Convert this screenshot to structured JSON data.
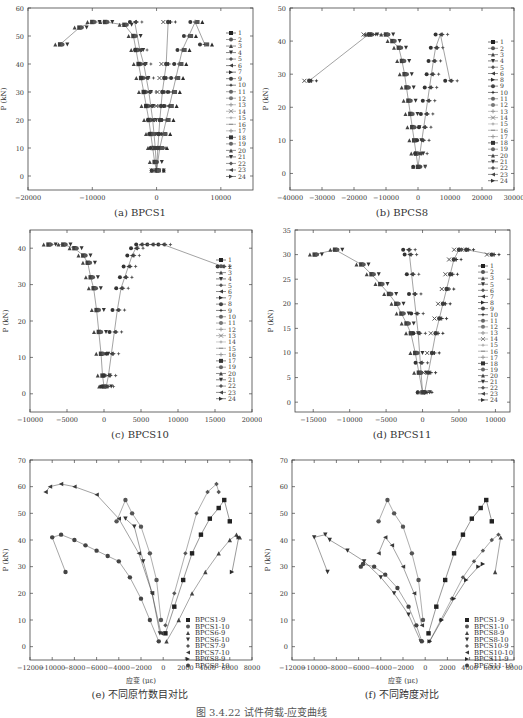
{
  "figure_caption": "图 3.4.22  试件荷载-应变曲线",
  "chart_data": [
    {
      "id": "a",
      "type": "scatter",
      "title": "(a) BPCS1",
      "xlabel": "应变 (με)",
      "ylabel": "P (kN)",
      "xlim": [
        -20000,
        15000
      ],
      "ylim": [
        -5,
        60
      ],
      "xticks": [
        -20000,
        -10000,
        0,
        10000
      ],
      "yticks": [
        0,
        10,
        20,
        30,
        40,
        50,
        60
      ],
      "legend": [
        "1",
        "2",
        "3",
        "4",
        "5",
        "6",
        "7",
        "9",
        "10",
        "11",
        "12",
        "13",
        "14",
        "15",
        "16",
        "17",
        "18",
        "19",
        "20",
        "21",
        "22",
        "23",
        "24"
      ],
      "legend_position": "right",
      "series": [
        {
          "name": "compression-outer",
          "x": [
            0,
            -300,
            -600,
            -900,
            -1200,
            -1600,
            -2000,
            -2400,
            -2800,
            -3200,
            -3600,
            -5000,
            -8000,
            -10000,
            -12000,
            -15000
          ],
          "y": [
            2,
            5,
            10,
            15,
            20,
            25,
            30,
            35,
            40,
            45,
            50,
            54,
            55,
            55,
            53,
            47
          ]
        },
        {
          "name": "compression-inner",
          "x": [
            0,
            -200,
            -400,
            -600,
            -900,
            -1200,
            -1600,
            -2000,
            -2600,
            -3400
          ],
          "y": [
            2,
            10,
            15,
            20,
            25,
            30,
            35,
            40,
            45,
            55
          ]
        },
        {
          "name": "tension-near",
          "x": [
            0,
            200,
            350,
            500,
            700,
            900,
            1200,
            1500,
            1800
          ],
          "y": [
            2,
            10,
            15,
            20,
            25,
            30,
            35,
            40,
            55
          ]
        },
        {
          "name": "tension-outer",
          "x": [
            0,
            500,
            1000,
            1500,
            2000,
            2500,
            3000,
            3500,
            4000,
            5000,
            6000,
            7500
          ],
          "y": [
            2,
            10,
            15,
            20,
            25,
            30,
            35,
            40,
            45,
            50,
            55,
            47
          ]
        }
      ]
    },
    {
      "id": "b",
      "type": "scatter",
      "title": "(b) BPCS8",
      "xlabel": "应变 (με)",
      "ylabel": "P (kN)",
      "xlim": [
        -40000,
        30000
      ],
      "ylim": [
        -5,
        50
      ],
      "xticks": [
        -40000,
        -30000,
        -20000,
        -10000,
        0,
        10000,
        20000,
        30000
      ],
      "yticks": [
        0,
        10,
        20,
        30,
        40,
        50
      ],
      "legend": [
        "1",
        "2",
        "3",
        "4",
        "5",
        "6",
        "8",
        "9",
        "10",
        "11",
        "12",
        "13",
        "14",
        "15",
        "16",
        "17",
        "18",
        "19",
        "20",
        "21",
        "22",
        "23",
        "24"
      ],
      "legend_position": "right",
      "series": [
        {
          "name": "compression",
          "x": [
            0,
            -600,
            -1200,
            -1800,
            -2400,
            -3000,
            -3600,
            -4200,
            -5000,
            -6000,
            -8000,
            -10000,
            -15000
          ],
          "y": [
            2,
            6,
            10,
            14,
            18,
            22,
            26,
            30,
            34,
            38,
            40,
            42,
            42
          ]
        },
        {
          "name": "tension",
          "x": [
            0,
            600,
            1200,
            1800,
            2400,
            3000,
            3600,
            4200,
            4800,
            5500,
            7000,
            10000
          ],
          "y": [
            2,
            6,
            10,
            14,
            18,
            22,
            26,
            30,
            34,
            38,
            42,
            28
          ]
        },
        {
          "name": "outlier",
          "x": [
            -15500,
            -34000
          ],
          "y": [
            42,
            28
          ]
        }
      ]
    },
    {
      "id": "c",
      "type": "scatter",
      "title": "(c) BPCS10",
      "xlabel": "应变 (με)",
      "ylabel": "P (kN)",
      "xlim": [
        -10000,
        20000
      ],
      "ylim": [
        -5,
        45
      ],
      "xticks": [
        -10000,
        -5000,
        0,
        5000,
        10000,
        15000,
        20000
      ],
      "yticks": [
        0,
        10,
        20,
        30,
        40
      ],
      "legend": [
        "1",
        "2",
        "3",
        "4",
        "5",
        "6",
        "7",
        "8",
        "9",
        "10",
        "11",
        "12",
        "13",
        "14",
        "15",
        "16",
        "17",
        "19",
        "20",
        "21",
        "22",
        "23",
        "24"
      ],
      "legend_position": "right",
      "series": [
        {
          "name": "compression",
          "x": [
            0,
            -200,
            -400,
            -700,
            -1000,
            -1400,
            -1800,
            -2200,
            -2800,
            -4000,
            -5500,
            -7500
          ],
          "y": [
            2,
            5,
            11,
            17,
            23,
            29,
            32,
            36,
            38,
            40,
            41,
            41
          ]
        },
        {
          "name": "tension",
          "x": [
            300,
            600,
            1000,
            1400,
            1800,
            2300,
            2800,
            3300,
            3800,
            4300,
            5000,
            6500,
            8000,
            16000
          ],
          "y": [
            2,
            5,
            11,
            17,
            23,
            29,
            32,
            35,
            38,
            40,
            41,
            41,
            41,
            35
          ]
        }
      ]
    },
    {
      "id": "d",
      "type": "scatter",
      "title": "(d) BPCS11",
      "xlabel": "应变 (με)",
      "ylabel": "P (kN)",
      "xlim": [
        -17500,
        12000
      ],
      "ylim": [
        -2,
        35
      ],
      "xticks": [
        -15000,
        -10000,
        -5000,
        0,
        5000,
        10000
      ],
      "yticks": [
        0,
        5,
        10,
        15,
        20,
        25,
        30,
        35
      ],
      "legend": [
        "1",
        "2",
        "3",
        "5",
        "6",
        "7",
        "8",
        "9",
        "10",
        "11",
        "12",
        "13",
        "14",
        "15",
        "16",
        "17",
        "18",
        "19",
        "20",
        "21",
        "22",
        "23",
        "24"
      ],
      "legend_position": "right",
      "series": [
        {
          "name": "compression-outer",
          "x": [
            0,
            -500,
            -1000,
            -1600,
            -2200,
            -2900,
            -3600,
            -4600,
            -5800,
            -7000,
            -8400,
            -12000,
            -14800
          ],
          "y": [
            2,
            6,
            10,
            14,
            16,
            18,
            20,
            22,
            24,
            26,
            28,
            31,
            30
          ]
        },
        {
          "name": "compression-inner",
          "x": [
            0,
            -300,
            -600,
            -900,
            -1200,
            -1500,
            -1800,
            -2000
          ],
          "y": [
            2,
            8,
            14,
            18,
            22,
            26,
            30,
            31
          ]
        },
        {
          "name": "tension",
          "x": [
            300,
            800,
            1300,
            1800,
            2300,
            2800,
            3300,
            3800,
            4300,
            5000,
            6000,
            9500
          ],
          "y": [
            2,
            6,
            10,
            14,
            17,
            20,
            23,
            26,
            29,
            31,
            31,
            30
          ]
        }
      ]
    },
    {
      "id": "e",
      "type": "scatter",
      "title": "(e) 不同原竹数目对比",
      "xlabel": "应变 (με)",
      "ylabel": "P (kN)",
      "xlim": [
        -12000,
        8000
      ],
      "ylim": [
        -5,
        70
      ],
      "xticks": [
        -12000,
        -10000,
        -8000,
        -6000,
        -4000,
        -2000,
        0,
        2000,
        4000,
        6000,
        8000
      ],
      "yticks": [
        0,
        10,
        20,
        30,
        40,
        50,
        60,
        70
      ],
      "legend": [
        "BPCS1-9",
        "BPCS1-10",
        "BPCS6-9",
        "BPCS6-10",
        "BPCS7-9",
        "BPCS7-10",
        "BPCS8-9",
        "BPCS8-10"
      ],
      "legend_position": "lower right",
      "series": [
        {
          "name": "BPCS1-9",
          "x": [
            200,
            1000,
            1800,
            2600,
            3400,
            4200,
            5000,
            5500,
            6000
          ],
          "y": [
            5,
            15,
            25,
            35,
            42,
            48,
            52,
            55,
            47
          ]
        },
        {
          "name": "BPCS1-10",
          "x": [
            -200,
            -600,
            -1200,
            -2000,
            -2800,
            -3400,
            -4200
          ],
          "y": [
            10,
            25,
            35,
            45,
            50,
            55,
            47
          ]
        },
        {
          "name": "BPCS6-9",
          "x": [
            300,
            1400,
            2600,
            3800,
            5000,
            6000,
            6600,
            6900
          ],
          "y": [
            2,
            10,
            20,
            28,
            35,
            40,
            42,
            41
          ]
        },
        {
          "name": "BPCS6-10",
          "x": [
            -300,
            -1000,
            -1800,
            -2600,
            -3400
          ],
          "y": [
            5,
            20,
            32,
            45,
            48
          ]
        },
        {
          "name": "BPCS7-9",
          "x": [
            200,
            1000,
            2000,
            3000,
            4000,
            4800,
            5000
          ],
          "y": [
            8,
            20,
            35,
            50,
            58,
            61,
            58
          ]
        },
        {
          "name": "BPCS7-10",
          "x": [
            -200,
            -1000,
            -2200,
            -4000,
            -6000,
            -8000,
            -9200,
            -10200,
            -10600
          ],
          "y": [
            5,
            20,
            35,
            48,
            57,
            60,
            61,
            60,
            58
          ]
        },
        {
          "name": "BPCS8-9",
          "x": [
            6200,
            6800
          ],
          "y": [
            28,
            41
          ]
        },
        {
          "name": "BPCS8-10",
          "x": [
            -400,
            -1200,
            -2000,
            -3000,
            -4000,
            -5000,
            -6000,
            -7000,
            -8000,
            -9200,
            -10000,
            -8800
          ],
          "y": [
            2,
            10,
            18,
            26,
            32,
            34,
            36,
            38,
            40,
            42,
            41,
            28
          ]
        }
      ]
    },
    {
      "id": "f",
      "type": "scatter",
      "title": "(f) 不同跨度对比",
      "xlabel": "应变 (με)",
      "ylabel": "P (kN)",
      "xlim": [
        -12000,
        8000
      ],
      "ylim": [
        -5,
        70
      ],
      "xticks": [
        -12000,
        -10000,
        -8000,
        -6000,
        -4000,
        -2000,
        0,
        2000,
        4000,
        6000,
        8000
      ],
      "yticks": [
        0,
        10,
        20,
        30,
        40,
        50,
        60,
        70
      ],
      "legend": [
        "BPCS1-9",
        "BPCS1-10",
        "BPCS8-9",
        "BPCS8-10",
        "BPCS10-9",
        "BPCS10-10",
        "BPCS11-9",
        "BPCS11-10"
      ],
      "legend_position": "lower right",
      "series": [
        {
          "name": "BPCS1-9",
          "x": [
            300,
            1000,
            1800,
            2600,
            3400,
            4200,
            5000,
            5500,
            6000
          ],
          "y": [
            5,
            15,
            25,
            35,
            42,
            48,
            52,
            55,
            47
          ]
        },
        {
          "name": "BPCS1-10",
          "x": [
            -200,
            -600,
            -1200,
            -2000,
            -2800,
            -3400,
            -4200
          ],
          "y": [
            10,
            25,
            35,
            45,
            50,
            55,
            47
          ]
        },
        {
          "name": "BPCS8-9",
          "x": [
            6300,
            6800
          ],
          "y": [
            28,
            41
          ]
        },
        {
          "name": "BPCS8-10",
          "x": [
            -400,
            -1500,
            -2800,
            -4000,
            -5500,
            -7000,
            -8600,
            -9000,
            -10000,
            -8800
          ],
          "y": [
            2,
            12,
            20,
            26,
            32,
            36,
            40,
            42,
            41,
            28
          ]
        },
        {
          "name": "BPCS10-9",
          "x": [
            400,
            1400,
            2400,
            3400,
            4400,
            5200,
            6000,
            6600
          ],
          "y": [
            2,
            10,
            18,
            26,
            32,
            36,
            40,
            42
          ]
        },
        {
          "name": "BPCS10-10",
          "x": [
            -300,
            -1000,
            -2000,
            -3000,
            -3600,
            -4200
          ],
          "y": [
            8,
            20,
            30,
            38,
            41,
            35
          ]
        },
        {
          "name": "BPCS11-9",
          "x": [
            400,
            1500,
            2600,
            3700,
            4800,
            5200
          ],
          "y": [
            2,
            10,
            18,
            25,
            30,
            31
          ]
        },
        {
          "name": "BPCS11-10",
          "x": [
            -300,
            -800,
            -1500,
            -2500,
            -3600,
            -4600,
            -5600,
            -5800
          ],
          "y": [
            2,
            8,
            15,
            22,
            27,
            30,
            31,
            30
          ]
        }
      ]
    }
  ]
}
